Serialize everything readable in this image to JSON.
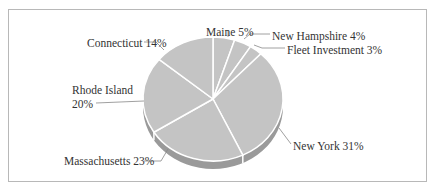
{
  "chart_data": {
    "type": "pie",
    "title": "",
    "style": "3d",
    "categories": [
      "Maine",
      "New Hampshire",
      "Fleet Investment",
      "New York",
      "Massachusetts",
      "Rhode Island",
      "Connecticut"
    ],
    "values": [
      5,
      4,
      3,
      31,
      23,
      20,
      14
    ],
    "unit": "%",
    "labels": [
      {
        "name": "Maine",
        "text": "Maine 5%"
      },
      {
        "name": "New Hampshire",
        "text": "New Hampshire 4%"
      },
      {
        "name": "Fleet Investment",
        "text": "Fleet Investment 3%"
      },
      {
        "name": "New York",
        "text": "New York 31%"
      },
      {
        "name": "Massachusetts",
        "text": "Massachusetts 23%"
      },
      {
        "name": "Rhode Island",
        "text_line1": "Rhode Island",
        "text_line2": "20%"
      },
      {
        "name": "Connecticut",
        "text": "Connecticut 14%"
      }
    ],
    "legend": "none",
    "colors": {
      "slice": "#c4c4c4",
      "side": "#9a9a9a",
      "separator": "#ffffff",
      "leader": "#888888",
      "frame": "#b8b8b8"
    }
  }
}
